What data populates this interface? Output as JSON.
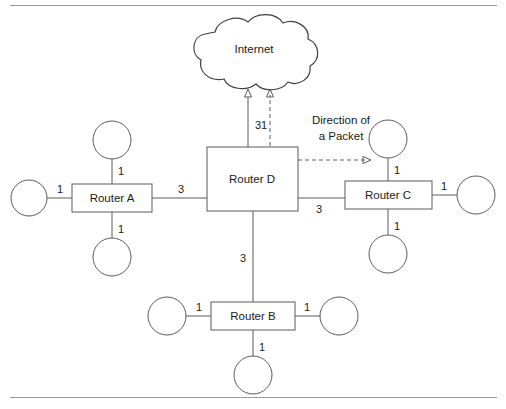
{
  "figure": {
    "background_color": "#ffffff",
    "line_color": "#5a5a5a",
    "text_color": "#1a1a1a",
    "rule_color": "#9a9a9a"
  },
  "cloud": {
    "label": "Internet"
  },
  "routers": {
    "a": {
      "label": "Router A"
    },
    "b": {
      "label": "Router B"
    },
    "c": {
      "label": "Router C"
    },
    "d": {
      "label": "Router D"
    }
  },
  "annotation": {
    "line1": "Direction of",
    "line2": "a Packet"
  },
  "costs": {
    "d_to_internet": "31",
    "a_to_d": "3",
    "d_to_c": "3",
    "d_to_b": "3",
    "a_top": "1",
    "a_left": "1",
    "a_bottom": "1",
    "b_left": "1",
    "b_right": "1",
    "b_bottom": "1",
    "c_top": "1",
    "c_right": "1",
    "c_bottom": "1"
  }
}
